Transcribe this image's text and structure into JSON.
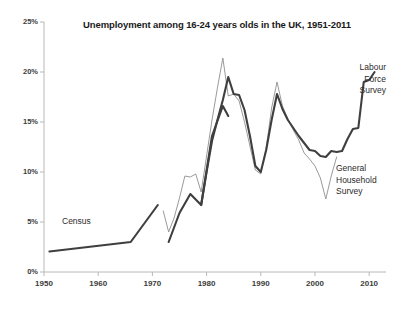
{
  "chart_data": {
    "type": "line",
    "title": "Unemployment among 16-24 years olds in the UK, 1951-2011",
    "xlabel": "",
    "ylabel": "",
    "xlim": [
      1950,
      2012
    ],
    "ylim": [
      0,
      25
    ],
    "grid": false,
    "legend_position": "inline-annotations",
    "y_tick_labels": [
      "0%",
      "5%",
      "10%",
      "15%",
      "20%",
      "25%"
    ],
    "y_ticks": [
      0,
      5,
      10,
      15,
      20,
      25
    ],
    "x_tick_labels": [
      "1950",
      "1960",
      "1970",
      "1980",
      "1990",
      "2000",
      "2010"
    ],
    "x_ticks": [
      1950,
      1960,
      1970,
      1980,
      1990,
      2000,
      2010
    ],
    "annotations": [
      {
        "text": "Census",
        "x": 1958,
        "y": 4.4
      },
      {
        "text": "Labour\nForce\nSurvey",
        "x": 2006,
        "y": 21.5
      },
      {
        "text": "General\nHousehold\nSurvey",
        "x": 2006,
        "y": 11.2
      }
    ],
    "series": [
      {
        "name": "Census",
        "style": "thick-dark",
        "color": "#3f3f3f",
        "width": 2.1,
        "x": [
          1951,
          1966,
          1971
        ],
        "values": [
          2.05,
          3.0,
          6.7
        ]
      },
      {
        "name": "General Household Survey",
        "style": "thin-grey",
        "color": "#8e8e8e",
        "width": 0.9,
        "x": [
          1972,
          1973,
          1974,
          1975,
          1976,
          1977,
          1978,
          1979,
          1980,
          1981,
          1982,
          1983,
          1984,
          1985,
          1986,
          1987,
          1988,
          1989,
          1990,
          1991,
          1992,
          1993,
          1994,
          1995,
          1996,
          1997,
          1998,
          1999,
          2000,
          2001,
          2002,
          2003,
          2004
        ],
        "values": [
          6.1,
          4.0,
          5.4,
          7.4,
          9.6,
          9.5,
          9.8,
          8.0,
          11.6,
          15.2,
          18.4,
          21.4,
          17.6,
          17.8,
          17.1,
          15.0,
          12.6,
          10.2,
          9.8,
          12.4,
          16.4,
          19.0,
          16.6,
          15.3,
          14.2,
          13.2,
          11.9,
          11.3,
          10.6,
          9.4,
          7.3,
          9.6,
          11.5
        ]
      },
      {
        "name": "Labour Force Survey (early)",
        "style": "thick-dark",
        "color": "#3f3f3f",
        "width": 2.1,
        "x": [
          1973,
          1975,
          1977,
          1979,
          1981,
          1983,
          1984
        ],
        "values": [
          3.0,
          5.9,
          7.8,
          6.7,
          13.6,
          16.6,
          15.6
        ]
      },
      {
        "name": "Labour Force Survey",
        "style": "thick-dark",
        "color": "#3f3f3f",
        "width": 2.1,
        "x": [
          1979,
          1980,
          1981,
          1982,
          1983,
          1984,
          1985,
          1986,
          1987,
          1988,
          1989,
          1990,
          1991,
          1992,
          1993,
          1994,
          1995,
          1996,
          1997,
          1998,
          1999,
          2000,
          2001,
          2002,
          2003,
          2004,
          2005,
          2006,
          2007,
          2008,
          2009,
          2010,
          2011
        ],
        "values": [
          6.7,
          10.0,
          13.1,
          15.2,
          17.2,
          19.5,
          17.8,
          17.7,
          16.2,
          13.6,
          10.6,
          10.0,
          12.2,
          15.2,
          17.8,
          16.3,
          15.2,
          14.4,
          13.6,
          12.9,
          12.2,
          12.1,
          11.6,
          11.5,
          12.1,
          12.0,
          12.1,
          13.3,
          14.3,
          14.4,
          19.0,
          19.2,
          20.0
        ]
      }
    ]
  }
}
